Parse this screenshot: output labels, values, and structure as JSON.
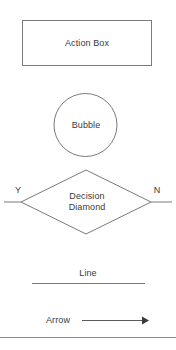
{
  "diagram": {
    "stroke_color": "#7a7a7a",
    "text_color": "#3a3a3a",
    "background_color": "#ffffff",
    "shapes": {
      "action_box": {
        "label": "Action Box",
        "type": "rectangle"
      },
      "bubble": {
        "label": "Bubble",
        "type": "circle"
      },
      "decision_diamond": {
        "label_line1": "Decision",
        "label_line2": "Diamond",
        "type": "diamond",
        "branch_yes": "Y",
        "branch_no": "N"
      },
      "line": {
        "label": "Line",
        "type": "line"
      },
      "arrow": {
        "label": "Arrow",
        "type": "arrow"
      }
    },
    "footer_rule": true
  }
}
